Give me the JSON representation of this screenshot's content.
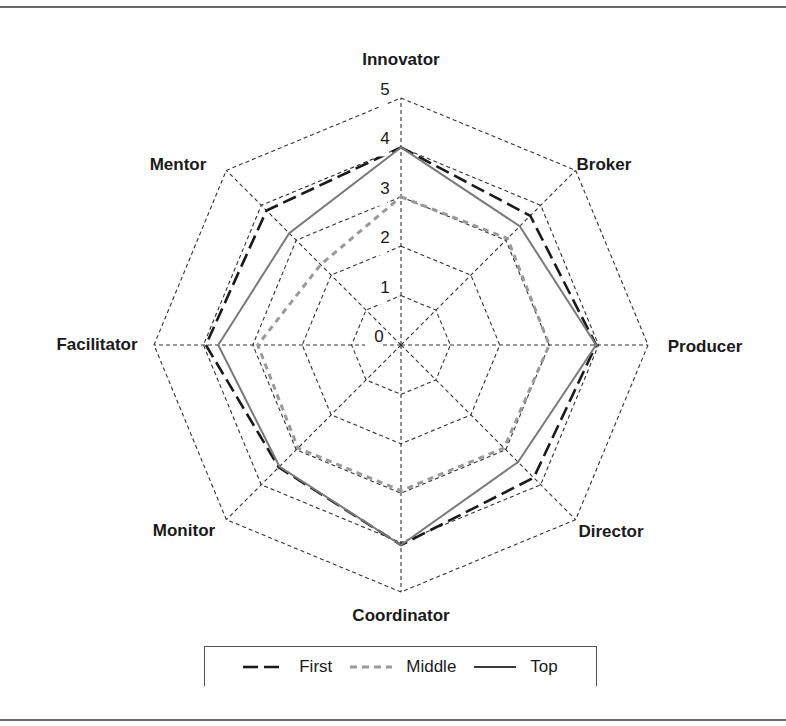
{
  "chart_data": {
    "type": "radar",
    "title": "",
    "categories": [
      "Innovator",
      "Broker",
      "Producer",
      "Director",
      "Coordinator",
      "Monitor",
      "Facilitator",
      "Mentor"
    ],
    "radial_ticks": [
      "0",
      "1",
      "2",
      "3",
      "4",
      "5"
    ],
    "rlim": [
      0,
      5
    ],
    "grid": true,
    "legend_position": "bottom",
    "series": [
      {
        "name": "First",
        "values": [
          4.0,
          3.7,
          3.95,
          3.8,
          4.05,
          3.5,
          3.95,
          3.85
        ],
        "color": "#1a1a1a",
        "dash": "14,6",
        "width": 2.6
      },
      {
        "name": "Middle",
        "values": [
          3.0,
          3.05,
          3.0,
          2.95,
          2.95,
          2.95,
          2.9,
          2.3
        ],
        "color": "#9a9a9a",
        "dash": "6,5",
        "width": 3.0
      },
      {
        "name": "Top",
        "values": [
          4.0,
          3.4,
          3.95,
          3.35,
          4.05,
          3.48,
          3.7,
          3.2
        ],
        "color": "#7a7a7a",
        "dash": "",
        "width": 2.0
      }
    ]
  },
  "legend": {
    "items": [
      {
        "label": "First"
      },
      {
        "label": "Middle"
      },
      {
        "label": "Top"
      }
    ]
  }
}
